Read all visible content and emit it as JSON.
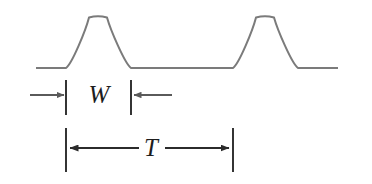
{
  "figure": {
    "background_color": "#ffffff",
    "waveform_color": "#7b7b7b",
    "annotation_color": "#2b2b2b",
    "labels": {
      "pulse_width": "W",
      "period": "T"
    },
    "label_meanings": {
      "pulse_width": "pulse width",
      "period": "period"
    },
    "waveform": {
      "type": "pulse-train",
      "baseline_y": 68,
      "peak_y": 16,
      "baseline_start_x": 36,
      "baseline_end_x": 338,
      "pulses": [
        {
          "rise_x": 66,
          "peak_x": 98,
          "fall_x": 131
        },
        {
          "rise_x": 233,
          "peak_x": 265,
          "fall_x": 298
        }
      ]
    },
    "dimension_rows": [
      {
        "name": "pulse-width",
        "label": "W",
        "label_x": 99,
        "label_y": 103,
        "axis_y": 95,
        "tick_left_x": 66,
        "tick_right_x": 131,
        "tick_top_y": 80,
        "tick_bottom_y": 115,
        "arrow_direction": "inward",
        "left_arrow_from_x": 30,
        "left_arrow_to_x": 64,
        "right_arrow_from_x": 172,
        "right_arrow_to_x": 134
      },
      {
        "name": "period",
        "label": "T",
        "label_x": 151,
        "label_y": 156,
        "axis_y": 148,
        "tick_left_x": 66,
        "tick_right_x": 233,
        "tick_top_y": 128,
        "tick_bottom_y": 172,
        "arrow_direction": "outward",
        "left_arrow_from_x": 139,
        "left_arrow_to_x": 70,
        "right_arrow_from_x": 165,
        "right_arrow_to_x": 229
      }
    ]
  }
}
